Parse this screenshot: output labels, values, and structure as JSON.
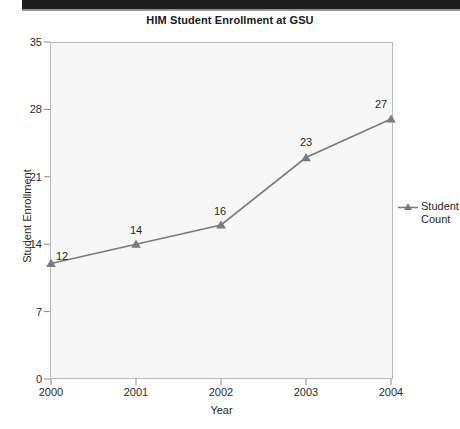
{
  "chart_data": {
    "type": "line",
    "title": "HIM Student Enrollment at GSU",
    "xlabel": "Year",
    "ylabel": "Student Enrollment",
    "categories": [
      "2000",
      "2001",
      "2002",
      "2003",
      "2004"
    ],
    "values": [
      12,
      14,
      16,
      23,
      27
    ],
    "point_labels": [
      "12",
      "14",
      "16",
      "23",
      "27"
    ],
    "ylim": [
      0,
      35
    ],
    "yticks": [
      "0",
      "7",
      "14",
      "21",
      "28",
      "35"
    ],
    "ytick_values": [
      0,
      7,
      14,
      21,
      28,
      35
    ],
    "xticks": [
      "2000",
      "2001",
      "2002",
      "2003",
      "2004"
    ],
    "grid": false,
    "legend_position": "right",
    "series": [
      {
        "name": "Student Count",
        "values": [
          12,
          14,
          16,
          23,
          27
        ],
        "marker": "triangle",
        "color": "#7b7b7b"
      }
    ]
  },
  "legend": {
    "entries": [
      {
        "label_line1": "Student",
        "label_line2": "Count",
        "full_label": "Student Count"
      }
    ]
  },
  "colors": {
    "line": "#7b7b7b",
    "marker": "#7b7b7b",
    "plot_background": "#f7f7f7",
    "plot_border": "#b9b9b9",
    "axis_text": "#2b2b2b",
    "title_text": "#1a1a1a",
    "top_band": "#1d1d1d"
  }
}
